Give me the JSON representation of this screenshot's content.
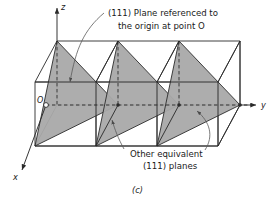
{
  "figure": {
    "caption": "(c)",
    "annotations": {
      "primary_plane": {
        "line1": "(111) Plane referenced to",
        "line2": "the origin at point O"
      },
      "equivalent_planes": {
        "line1": "Other equivalent",
        "line2": "(111) planes"
      }
    },
    "axes": {
      "z": "z",
      "y": "y",
      "x": "x"
    },
    "origin": {
      "label": "O"
    },
    "colors": {
      "plane_fill": "#a9a9a9",
      "line": "#2b2b2b",
      "leader": "#6e6e6e",
      "background": "#ffffff"
    }
  }
}
